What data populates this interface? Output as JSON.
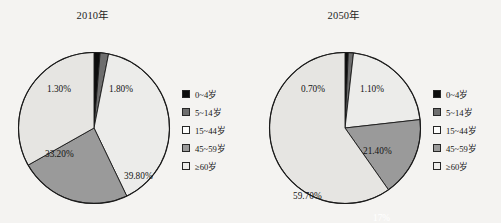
{
  "background_color": "#f4f3f1",
  "palette": {
    "age_0_4": "#0d0d0d",
    "age_5_14": "#6e6e6e",
    "age_15_44": "#ececea",
    "age_45_59": "#9a9a9a",
    "age_60_plus": "#e6e5e2",
    "outline": "#1a1a1a"
  },
  "legend": {
    "items": [
      {
        "label": "0~4岁",
        "color": "#0d0d0d"
      },
      {
        "label": "5~14岁",
        "color": "#6e6e6e"
      },
      {
        "label": "15~44岁",
        "color": "#fdfdfc"
      },
      {
        "label": "45~59岁",
        "color": "#9a9a9a"
      },
      {
        "label": "≥60岁",
        "color": "#eeedeb"
      }
    ]
  },
  "chart_data": [
    {
      "type": "pie",
      "title": "2010年",
      "categories": [
        "0~4岁",
        "5~14岁",
        "15~44岁",
        "45~59岁",
        "≥60岁"
      ],
      "values": [
        1.3,
        1.8,
        39.8,
        24,
        33.2
      ],
      "labels": [
        "1.30%",
        "1.80%",
        "39.80%",
        "24%",
        "33.20%"
      ],
      "colors": [
        "#0d0d0d",
        "#6e6e6e",
        "#ececea",
        "#9a9a9a",
        "#e6e5e2"
      ],
      "label_positions": [
        {
          "x": 30,
          "y": 33,
          "style": "dark",
          "leader": true
        },
        {
          "x": 92,
          "y": 33,
          "style": "dark",
          "leader": false
        },
        {
          "x": 107,
          "y": 120,
          "style": "dark",
          "leader": false
        },
        {
          "x": 63,
          "y": 178,
          "style": "light",
          "leader": false
        },
        {
          "x": 28,
          "y": 98,
          "style": "dark",
          "leader": false
        }
      ],
      "start_angle_deg": 0,
      "direction": "clockwise",
      "legend_position": "right"
    },
    {
      "type": "pie",
      "title": "2050年",
      "categories": [
        "0~4岁",
        "5~14岁",
        "15~44岁",
        "45~59岁",
        "≥60岁"
      ],
      "values": [
        0.7,
        1.1,
        21.4,
        17,
        59.7
      ],
      "labels": [
        "0.70%",
        "1.10%",
        "21.40%",
        "17%",
        "59.70%"
      ],
      "colors": [
        "#0d0d0d",
        "#6e6e6e",
        "#ececea",
        "#9a9a9a",
        "#e6e5e2"
      ],
      "label_positions": [
        {
          "x": 33,
          "y": 33,
          "style": "dark",
          "leader": true
        },
        {
          "x": 92,
          "y": 33,
          "style": "dark",
          "leader": false
        },
        {
          "x": 95,
          "y": 95,
          "style": "dark",
          "leader": false
        },
        {
          "x": 105,
          "y": 162,
          "style": "light",
          "leader": false
        },
        {
          "x": 25,
          "y": 140,
          "style": "dark",
          "leader": false
        }
      ],
      "start_angle_deg": 0,
      "direction": "clockwise",
      "legend_position": "right"
    }
  ]
}
